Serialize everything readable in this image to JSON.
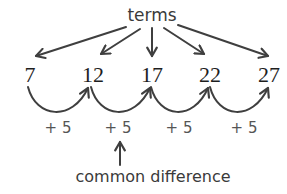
{
  "diagram": {
    "title_label": "terms",
    "terms": [
      "7",
      "12",
      "17",
      "22",
      "27"
    ],
    "differences": [
      "+ 5",
      "+ 5",
      "+ 5",
      "+ 5"
    ],
    "difference_label": "common difference",
    "colors": {
      "stroke": "#3f3f3f",
      "text": "#3a3a3a",
      "background": "#ffffff"
    }
  }
}
